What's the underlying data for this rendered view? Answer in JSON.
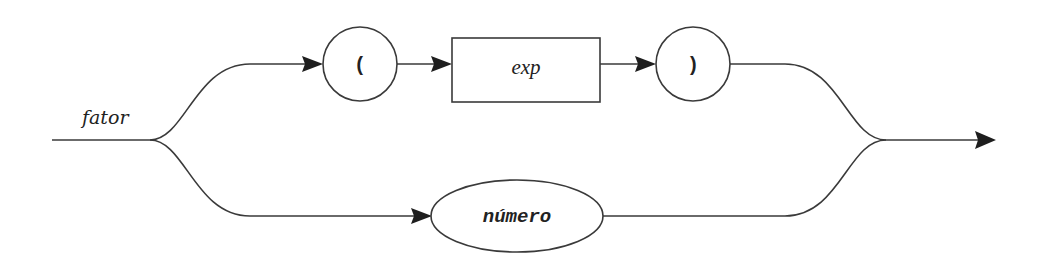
{
  "diagram": {
    "type": "syntax-diagram",
    "rule_name": "fator",
    "upper_branch": {
      "open_paren": "(",
      "nonterminal": "exp",
      "close_paren": ")"
    },
    "lower_branch": {
      "terminal": "número"
    },
    "colors": {
      "stroke": "#3a3a3a",
      "arrow": "#1e1e1e",
      "text": "#222222",
      "background": "#ffffff"
    }
  }
}
